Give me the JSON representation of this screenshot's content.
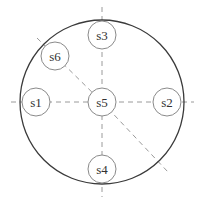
{
  "diagram": {
    "type": "node-layout",
    "colors": {
      "outer_circle": "#3a3a3a",
      "node_stroke": "#8a8a8a",
      "dashed_line": "#9a9a9a",
      "label": "#333333",
      "background": "#ffffff"
    },
    "outer_circle": {
      "cx": 102,
      "cy": 102,
      "r": 82
    },
    "nodes": [
      {
        "id": "s1",
        "label": "s1",
        "cx": 36,
        "cy": 102,
        "r": 14
      },
      {
        "id": "s2",
        "label": "s2",
        "cx": 167,
        "cy": 102,
        "r": 14
      },
      {
        "id": "s3",
        "label": "s3",
        "cx": 102,
        "cy": 35,
        "r": 14
      },
      {
        "id": "s4",
        "label": "s4",
        "cx": 102,
        "cy": 169,
        "r": 14
      },
      {
        "id": "s5",
        "label": "s5",
        "cx": 102,
        "cy": 102,
        "r": 14
      },
      {
        "id": "s6",
        "label": "s6",
        "cx": 55,
        "cy": 56,
        "r": 14
      }
    ],
    "dashed_lines": [
      {
        "id": "horizontal-axis",
        "x1": 11,
        "y1": 102,
        "x2": 194,
        "y2": 102
      },
      {
        "id": "vertical-axis",
        "x1": 102,
        "y1": 7,
        "x2": 102,
        "y2": 197
      },
      {
        "id": "diagonal-upper-left",
        "x1": 37,
        "y1": 38,
        "x2": 102,
        "y2": 102
      },
      {
        "id": "diagonal-lower-right",
        "x1": 102,
        "y1": 102,
        "x2": 168,
        "y2": 172
      }
    ]
  }
}
